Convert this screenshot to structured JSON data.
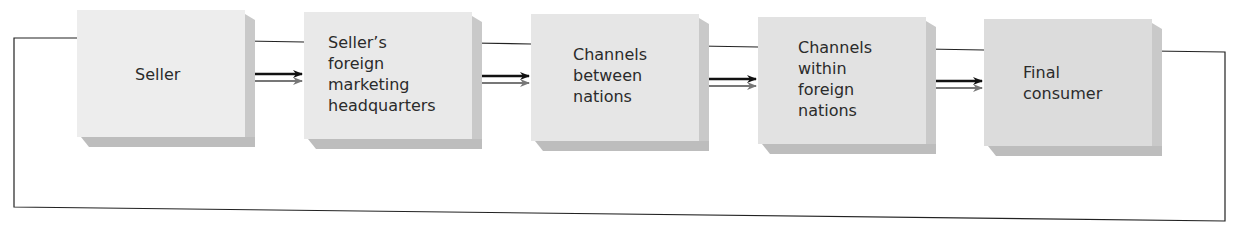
{
  "diagram": {
    "type": "flow",
    "direction": "left-to-right",
    "nodes": [
      {
        "id": "seller",
        "label": "Seller"
      },
      {
        "id": "hq",
        "label": "Seller’s\nforeign\nmarketing\nheadquarters"
      },
      {
        "id": "between",
        "label": "Channels\nbetween\nnations"
      },
      {
        "id": "within",
        "label": "Channels\nwithin\nforeign\nnations"
      },
      {
        "id": "consumer",
        "label": "Final\nconsumer"
      }
    ],
    "edges": [
      {
        "from": "seller",
        "to": "hq",
        "style": "double-arrow"
      },
      {
        "from": "hq",
        "to": "between",
        "style": "double-arrow"
      },
      {
        "from": "between",
        "to": "within",
        "style": "double-arrow"
      },
      {
        "from": "within",
        "to": "consumer",
        "style": "double-arrow"
      },
      {
        "from": "consumer",
        "to": "seller",
        "style": "feedback-line"
      }
    ],
    "colors": {
      "box_face": "#e9e9e9",
      "box_shadow": "#c4c4c4",
      "line": "#222222",
      "arrow_primary": "#111111",
      "arrow_secondary": "#7a7a7a"
    }
  }
}
